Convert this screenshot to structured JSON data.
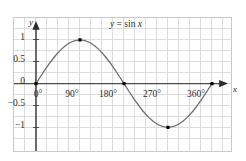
{
  "figure": {
    "background_color": "#ffffff",
    "frame_color": "#c9c9c9",
    "grid_color": "#dcdcdc",
    "axis_color": "#4a4a4a",
    "curve_color": "#6f6f6f",
    "marker_color": "#000000",
    "text_color": "#2b2b2b"
  },
  "equation": {
    "text": "y = sin x",
    "lhs": "y",
    "relation": "=",
    "rhs_function": "sin",
    "rhs_variable": "x"
  },
  "axis_names": {
    "x": "x",
    "y": "y"
  },
  "chart_data": {
    "type": "line",
    "xlabel": "x",
    "ylabel": "y",
    "xlim": [
      -45,
      405
    ],
    "ylim": [
      -1.35,
      1.35
    ],
    "grid": true,
    "legend": null,
    "x_tick_labels": [
      "0°",
      "90°",
      "180°",
      "270°",
      "360°"
    ],
    "x_tick_values": [
      0,
      90,
      180,
      270,
      360
    ],
    "y_tick_labels": [
      "1",
      "0.5",
      "0",
      "−0.5",
      "−1"
    ],
    "y_tick_values": [
      1,
      0.5,
      0,
      -0.5,
      -1
    ],
    "series": [
      {
        "name": "y = sin x",
        "x": [
          0,
          10,
          20,
          30,
          40,
          50,
          60,
          70,
          80,
          90,
          100,
          110,
          120,
          130,
          140,
          150,
          160,
          170,
          180,
          190,
          200,
          210,
          220,
          230,
          240,
          250,
          260,
          270,
          280,
          290,
          300,
          310,
          320,
          330,
          340,
          350,
          360
        ],
        "values": [
          0,
          0.174,
          0.342,
          0.5,
          0.643,
          0.766,
          0.866,
          0.94,
          0.985,
          1,
          0.985,
          0.94,
          0.866,
          0.766,
          0.643,
          0.5,
          0.342,
          0.174,
          0,
          -0.174,
          -0.342,
          -0.5,
          -0.643,
          -0.766,
          -0.866,
          -0.94,
          -0.985,
          -1,
          -0.985,
          -0.94,
          -0.866,
          -0.766,
          -0.643,
          -0.5,
          -0.342,
          -0.174,
          0
        ]
      }
    ],
    "markers": [
      {
        "x": 0,
        "y": 0,
        "label": "(0°, 0)"
      },
      {
        "x": 90,
        "y": 1,
        "label": "(90°, 1)"
      },
      {
        "x": 180,
        "y": 0,
        "label": "(180°, 0)"
      },
      {
        "x": 270,
        "y": -1,
        "label": "(270°, −1)"
      },
      {
        "x": 360,
        "y": 0,
        "label": "(360°, 0)"
      }
    ],
    "annotations": [
      {
        "text": "y = sin x",
        "x": 155,
        "y": 1.22
      }
    ]
  }
}
